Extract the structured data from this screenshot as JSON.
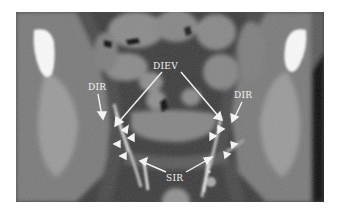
{
  "figure": {
    "labels": {
      "diev": "DIEV",
      "dir_left": "DIR",
      "dir_right": "DIR",
      "sir": "SIR",
      "asterisk": "*"
    },
    "colors": {
      "annotation": "#f2f2f2",
      "background": "#ffffff",
      "scan_base": "#3a3a3a"
    }
  }
}
